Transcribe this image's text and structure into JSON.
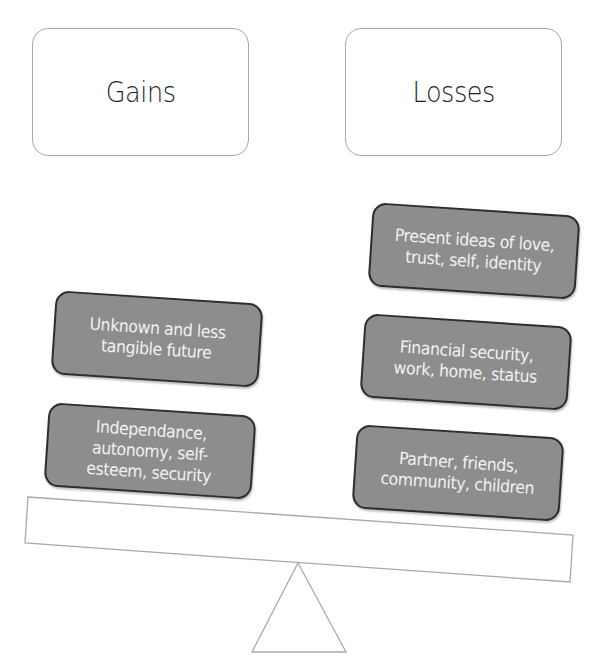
{
  "diagram": {
    "type": "balance-scale",
    "headers": {
      "left": "Gains",
      "right": "Losses"
    },
    "gains": [
      {
        "label": "Unknown and less tangible future"
      },
      {
        "label": "Independance, autonomy, self-esteem, security"
      }
    ],
    "losses": [
      {
        "label": "Present ideas of love, trust, self, identity"
      },
      {
        "label": "Financial security, work, home, status"
      },
      {
        "label": "Partner, friends, community, children"
      }
    ],
    "colors": {
      "box_fill": "#8d8d8d",
      "box_border": "#2e2e2e",
      "box_text": "#f2f2f2",
      "outline": "#a9a9a9",
      "header_text": "#1e1e1e"
    },
    "tilt_direction": "right side lower (losses outweigh gains)"
  }
}
